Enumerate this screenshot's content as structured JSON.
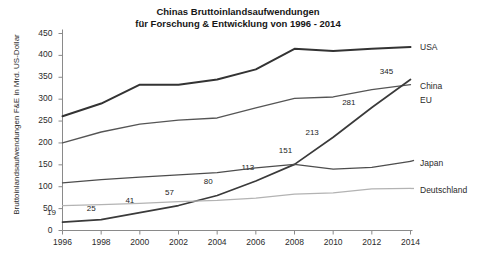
{
  "chart_data": {
    "type": "line",
    "title": "Chinas Bruttoinlandsaufwendungen\nfür Forschung & Entwicklung von 1996 - 2014",
    "xlabel": "",
    "ylabel": "Bruttoinlandsaufwendungen F&E in Mrd. US-Dollar",
    "x": [
      1996,
      1998,
      2000,
      2002,
      2004,
      2006,
      2008,
      2010,
      2012,
      2014
    ],
    "xtick_labels": [
      "1996",
      "1998",
      "2000",
      "2002",
      "2004",
      "2006",
      "2008",
      "2010",
      "2012",
      "2014"
    ],
    "xlim": [
      1996,
      2014
    ],
    "ylim": [
      0,
      450
    ],
    "ytick_labels": [
      "0",
      "50",
      "100",
      "150",
      "200",
      "250",
      "300",
      "350",
      "400",
      "450"
    ],
    "ytick_values": [
      0,
      50,
      100,
      150,
      200,
      250,
      300,
      350,
      400,
      450
    ],
    "grid": false,
    "legend_position": "right-inline",
    "series": [
      {
        "name": "USA",
        "color": "#333333",
        "width": 2.0,
        "values": [
          261,
          290,
          333,
          333,
          345,
          368,
          415,
          410,
          415,
          419
        ]
      },
      {
        "name": "EU",
        "color": "#555555",
        "width": 1.3,
        "values": [
          200,
          225,
          243,
          252,
          257,
          280,
          302,
          305,
          322,
          333
        ]
      },
      {
        "name": "China",
        "color": "#3a3a3a",
        "width": 1.7,
        "values": [
          19,
          25,
          41,
          57,
          80,
          113,
          151,
          213,
          281,
          345
        ],
        "point_labels": [
          "19",
          "25",
          "41",
          "57",
          "80",
          "113",
          "151",
          "213",
          "281",
          "345"
        ]
      },
      {
        "name": "Japan",
        "color": "#4d4d4d",
        "width": 1.3,
        "values": [
          109,
          116,
          122,
          127,
          132,
          143,
          151,
          140,
          144,
          158
        ]
      },
      {
        "name": "Deutschland",
        "color": "#b3b3b3",
        "width": 1.3,
        "values": [
          57,
          59,
          62,
          66,
          69,
          74,
          83,
          86,
          95,
          96
        ]
      }
    ],
    "annotations": [
      {
        "label": "USA",
        "series": "USA"
      },
      {
        "label": "China",
        "series": "China"
      },
      {
        "label": "EU",
        "series": "EU"
      },
      {
        "label": "Japan",
        "series": "Japan"
      },
      {
        "label": "Deutschland",
        "series": "Deutschland"
      }
    ]
  }
}
